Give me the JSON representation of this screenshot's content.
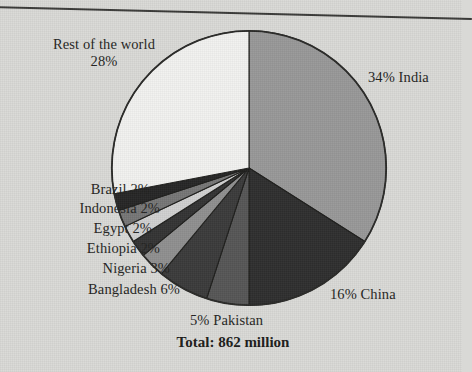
{
  "figure": {
    "caption": "Total: 862 million",
    "background_color": "#d9d9d6",
    "text_color": "#242422"
  },
  "chart_data": {
    "type": "pie",
    "title": "",
    "subtitle": "",
    "xlabel": "",
    "ylabel": "",
    "total_label": "Total: 862 million",
    "total_value": 862,
    "total_units": "million",
    "legend_position": "none",
    "grid": false,
    "labels_inline": true,
    "start_angle_deg": 0,
    "direction": "clockwise",
    "categories": [
      "India",
      "China",
      "Pakistan",
      "Bangladesh",
      "Nigeria",
      "Ethiopia",
      "Egypt",
      "Indonesia",
      "Brazil",
      "Rest of the world"
    ],
    "values": [
      34,
      16,
      5,
      6,
      3,
      2,
      2,
      2,
      2,
      28
    ],
    "units": "percent",
    "colors": [
      "#989898",
      "#2e2e2e",
      "#565656",
      "#3a3a3a",
      "#8f8f8f",
      "#333333",
      "#d0d0d0",
      "#767676",
      "#262626",
      "#f2f2f0"
    ],
    "slice_labels": [
      "34% India",
      "16% China",
      "5% Pakistan",
      "Bangladesh 6%",
      "Nigeria 3%",
      "Ethiopia 2%",
      "Egypt 2%",
      "Indonesia 2%",
      "Brazil 2%",
      "Rest of the world 28%"
    ]
  },
  "labels": {
    "rest_line1": "Rest of the world",
    "rest_line2": "28%",
    "india": "34% India",
    "china": "16% China",
    "pakistan": "5% Pakistan",
    "bangladesh": "Bangladesh 6%",
    "nigeria": "Nigeria 3%",
    "ethiopia": "Ethiopia 2%",
    "egypt": "Egypt 2%",
    "indonesia": "Indonesia 2%",
    "brazil": "Brazil 2%"
  }
}
